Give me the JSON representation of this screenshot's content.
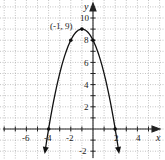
{
  "chart_data": {
    "type": "line",
    "title": "",
    "xlabel": "x",
    "ylabel": "y",
    "xlim": [
      -8,
      6
    ],
    "ylim": [
      -2.5,
      10.5
    ],
    "grid": true,
    "x_ticks": [
      -6,
      -4,
      -2,
      2,
      4
    ],
    "y_ticks": [
      -2,
      2,
      4,
      6,
      8,
      10
    ],
    "x_tick_labels": [
      "-6",
      "-4",
      "-2",
      "2",
      "4"
    ],
    "y_tick_labels": [
      "-2",
      "2",
      "4",
      "6",
      "8",
      "10"
    ],
    "function": "y = -(x + 1)^2 + 9",
    "vertex": {
      "x": -1,
      "y": 9,
      "label": "(-1, 9)"
    },
    "points": [
      {
        "x": -4,
        "y": 0
      },
      {
        "x": -2,
        "y": 8
      },
      {
        "x": -1,
        "y": 9
      },
      {
        "x": 0,
        "y": 8
      },
      {
        "x": 2,
        "y": 0
      }
    ],
    "series": [
      {
        "name": "parabola",
        "x": [
          -4.3,
          -4,
          -3,
          -2,
          -1,
          0,
          1,
          2,
          2.3
        ],
        "values": [
          -1.89,
          0,
          5,
          8,
          9,
          8,
          5,
          0,
          -1.89
        ]
      }
    ]
  },
  "labels": {
    "x_axis": "x",
    "y_axis": "y",
    "vertex": "(-1, 9)",
    "xt_m6": "-6",
    "xt_m4": "-4",
    "xt_m2": "-2",
    "xt_2": "2",
    "xt_4": "4",
    "yt_m2": "-2",
    "yt_2": "2",
    "yt_4": "4",
    "yt_6": "6",
    "yt_8": "8",
    "yt_10": "10"
  }
}
